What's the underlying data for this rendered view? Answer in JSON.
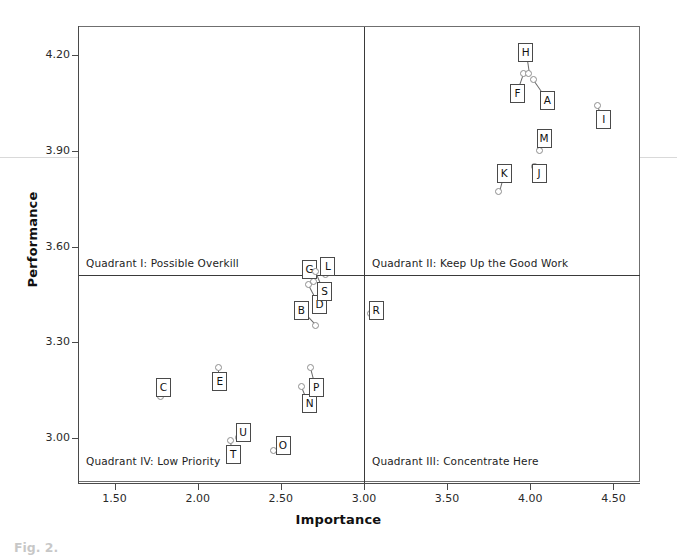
{
  "chart_data": {
    "type": "scatter",
    "title": "",
    "xlabel": "Importance",
    "ylabel": "Performance",
    "xlim": [
      1.28,
      4.66
    ],
    "ylim": [
      2.86,
      4.29
    ],
    "xticks": [
      "1.50",
      "2.00",
      "2.50",
      "3.00",
      "3.50",
      "4.00",
      "4.50"
    ],
    "xtick_values": [
      1.5,
      2.0,
      2.5,
      3.0,
      3.5,
      4.0,
      4.5
    ],
    "yticks": [
      "4.20",
      "3.90",
      "3.60",
      "3.30",
      "3.00"
    ],
    "ytick_values": [
      4.2,
      3.9,
      3.6,
      3.3,
      3.0
    ],
    "grid": false,
    "legend": "none",
    "crosshair": {
      "x": 3.0,
      "y": 3.51
    },
    "quadrants": [
      {
        "id": "I",
        "label": "Quadrant  I:  Possible Overkill",
        "corner": "top-left"
      },
      {
        "id": "II",
        "label": "Quadrant  II:  Keep Up the Good Work",
        "corner": "top-right"
      },
      {
        "id": "III",
        "label": "Quadrant  III:  Concentrate Here",
        "corner": "bottom-right"
      },
      {
        "id": "IV",
        "label": "Quadrant  IV:  Low Priority",
        "corner": "bottom-left"
      }
    ],
    "points": [
      {
        "label": "A",
        "x": 4.02,
        "y": 4.12,
        "lx": 4.1,
        "ly": 4.06
      },
      {
        "label": "B",
        "x": 2.71,
        "y": 3.35,
        "lx": 2.62,
        "ly": 3.4
      },
      {
        "label": "C",
        "x": 1.78,
        "y": 3.13,
        "lx": 1.79,
        "ly": 3.16
      },
      {
        "label": "D",
        "x": 2.67,
        "y": 3.48,
        "lx": 2.73,
        "ly": 3.42
      },
      {
        "label": "E",
        "x": 2.13,
        "y": 3.22,
        "lx": 2.13,
        "ly": 3.18
      },
      {
        "label": "F",
        "x": 3.96,
        "y": 4.14,
        "lx": 3.92,
        "ly": 4.08
      },
      {
        "label": "G",
        "x": 2.7,
        "y": 3.49,
        "lx": 2.67,
        "ly": 3.53
      },
      {
        "label": "H",
        "x": 3.99,
        "y": 4.14,
        "lx": 3.97,
        "ly": 4.21
      },
      {
        "label": "I",
        "x": 4.41,
        "y": 4.04,
        "lx": 4.44,
        "ly": 4.0
      },
      {
        "label": "J",
        "x": 4.03,
        "y": 3.85,
        "lx": 4.05,
        "ly": 3.83
      },
      {
        "label": "K",
        "x": 3.81,
        "y": 3.77,
        "lx": 3.84,
        "ly": 3.83
      },
      {
        "label": "L",
        "x": 2.77,
        "y": 3.51,
        "lx": 2.78,
        "ly": 3.54
      },
      {
        "label": "M",
        "x": 4.06,
        "y": 3.9,
        "lx": 4.08,
        "ly": 3.94
      },
      {
        "label": "N",
        "x": 2.63,
        "y": 3.16,
        "lx": 2.67,
        "ly": 3.11
      },
      {
        "label": "O",
        "x": 2.46,
        "y": 2.96,
        "lx": 2.51,
        "ly": 2.98
      },
      {
        "label": "P",
        "x": 2.68,
        "y": 3.22,
        "lx": 2.71,
        "ly": 3.16
      },
      {
        "label": "R",
        "x": 3.04,
        "y": 3.39,
        "lx": 3.07,
        "ly": 3.4
      },
      {
        "label": "S",
        "x": 2.71,
        "y": 3.52,
        "lx": 2.76,
        "ly": 3.46
      },
      {
        "label": "T",
        "x": 2.2,
        "y": 2.99,
        "lx": 2.21,
        "ly": 2.95
      },
      {
        "label": "U",
        "x": 2.25,
        "y": 3.0,
        "lx": 2.27,
        "ly": 3.02
      }
    ]
  },
  "caption": {
    "text": "Fig. 2."
  }
}
